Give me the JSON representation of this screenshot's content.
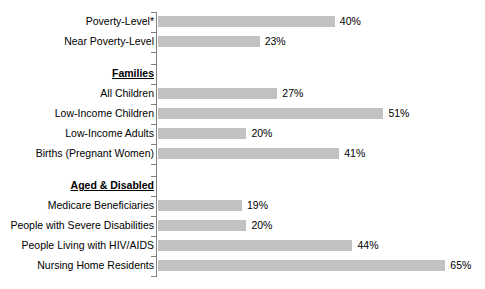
{
  "chart_data": {
    "type": "bar",
    "orientation": "horizontal",
    "title": "",
    "subtitle": "",
    "xlabel": "",
    "ylabel": "",
    "xlim": [
      0,
      65
    ],
    "grid": false,
    "legend": null,
    "value_suffix": "%",
    "bar_color": "#c2c2c2",
    "axis_color": "#808080",
    "categories": [
      "Poverty-Level*",
      "Near Poverty-Level",
      "All Children",
      "Low-Income Children",
      "Low-Income Adults",
      "Births (Pregnant Women)",
      "Medicare Beneficiaries",
      "People with Severe Disabilities",
      "People Living with HIV/AIDS",
      "Nursing Home Residents"
    ],
    "values": [
      40,
      23,
      27,
      51,
      20,
      41,
      19,
      20,
      44,
      65
    ],
    "value_labels": [
      "40%",
      "23%",
      "27%",
      "51%",
      "20%",
      "41%",
      "19%",
      "20%",
      "44%",
      "65%"
    ],
    "section_headers": [
      "Families",
      "Aged & Disabled"
    ],
    "rows": [
      {
        "kind": "bar",
        "label": "Poverty-Level*",
        "value": 40,
        "value_label": "40%"
      },
      {
        "kind": "bar",
        "label": "Near Poverty-Level",
        "value": 23,
        "value_label": "23%"
      },
      {
        "kind": "gap",
        "label": "",
        "value": null,
        "value_label": ""
      },
      {
        "kind": "header",
        "label": "Families",
        "value": null,
        "value_label": ""
      },
      {
        "kind": "bar",
        "label": "All Children",
        "value": 27,
        "value_label": "27%"
      },
      {
        "kind": "bar",
        "label": "Low-Income Children",
        "value": 51,
        "value_label": "51%"
      },
      {
        "kind": "bar",
        "label": "Low-Income Adults",
        "value": 20,
        "value_label": "20%"
      },
      {
        "kind": "bar",
        "label": "Births (Pregnant Women)",
        "value": 41,
        "value_label": "41%"
      },
      {
        "kind": "gap",
        "label": "",
        "value": null,
        "value_label": ""
      },
      {
        "kind": "header",
        "label": "Aged & Disabled",
        "value": null,
        "value_label": ""
      },
      {
        "kind": "bar",
        "label": "Medicare Beneficiaries",
        "value": 19,
        "value_label": "19%"
      },
      {
        "kind": "bar",
        "label": "People with Severe Disabilities",
        "value": 20,
        "value_label": "20%"
      },
      {
        "kind": "bar",
        "label": "People Living with HIV/AIDS",
        "value": 44,
        "value_label": "44%"
      },
      {
        "kind": "bar",
        "label": "Nursing Home Residents",
        "value": 65,
        "value_label": "65%"
      }
    ]
  }
}
